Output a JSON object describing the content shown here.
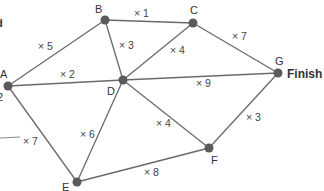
{
  "diagram": {
    "type": "weighted-graph",
    "nodes": [
      {
        "id": "A",
        "label": "A",
        "x": 8,
        "y": 86
      },
      {
        "id": "B",
        "label": "B",
        "x": 105,
        "y": 20
      },
      {
        "id": "C",
        "label": "C",
        "x": 193,
        "y": 23
      },
      {
        "id": "D",
        "label": "D",
        "x": 123,
        "y": 80
      },
      {
        "id": "E",
        "label": "E",
        "x": 77,
        "y": 182
      },
      {
        "id": "F",
        "label": "F",
        "x": 209,
        "y": 148
      },
      {
        "id": "G",
        "label": "G",
        "x": 278,
        "y": 73
      }
    ],
    "edges": [
      {
        "from": "A",
        "to": "B",
        "weight": "× 5"
      },
      {
        "from": "A",
        "to": "D",
        "weight": "× 2"
      },
      {
        "from": "A",
        "to": "E",
        "weight": "× 7"
      },
      {
        "from": "B",
        "to": "C",
        "weight": "× 1"
      },
      {
        "from": "B",
        "to": "D",
        "weight": "× 3"
      },
      {
        "from": "C",
        "to": "D",
        "weight": "× 4"
      },
      {
        "from": "C",
        "to": "G",
        "weight": "× 7"
      },
      {
        "from": "D",
        "to": "G",
        "weight": "× 9"
      },
      {
        "from": "D",
        "to": "F",
        "weight": "× 4"
      },
      {
        "from": "D",
        "to": "E",
        "weight": "× 6"
      },
      {
        "from": "E",
        "to": "F",
        "weight": "× 8"
      },
      {
        "from": "F",
        "to": "G",
        "weight": "× 3"
      }
    ],
    "finish_label": "Finish",
    "cropped_text": {
      "top_left": "d",
      "below_a": "2"
    }
  }
}
